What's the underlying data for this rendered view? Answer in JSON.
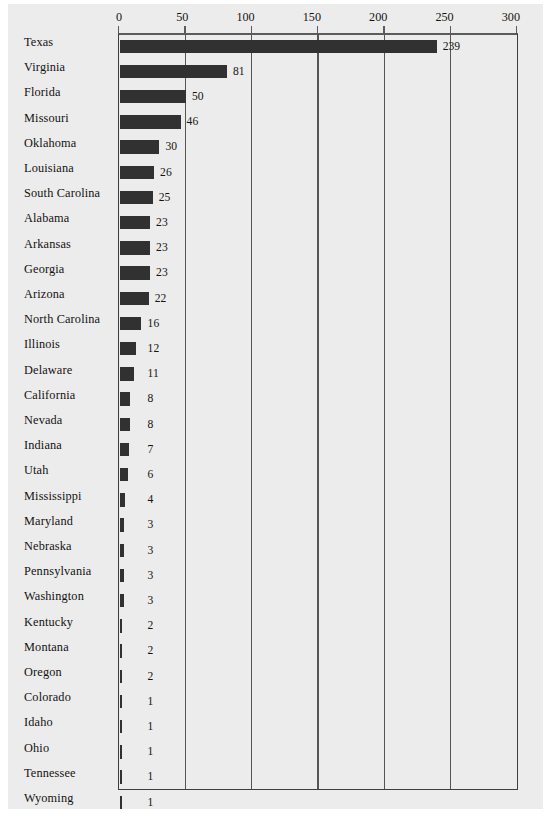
{
  "chart_data": {
    "type": "bar",
    "orientation": "horizontal",
    "title": "",
    "subtitle": "",
    "xlabel": "",
    "ylabel": "",
    "xlim": [
      0,
      300
    ],
    "xticks": [
      0,
      50,
      100,
      150,
      200,
      250,
      300
    ],
    "xtick_labels": [
      "0",
      "50",
      "100",
      "150",
      "200",
      "250",
      "300"
    ],
    "grid": true,
    "grid_axis": "x",
    "legend": false,
    "bar_color": "#313132",
    "axis_color": "#3e3e3e",
    "background_color": "#ececed",
    "value_labels": true,
    "categories": [
      "Texas",
      "Virginia",
      "Florida",
      "Missouri",
      "Oklahoma",
      "Louisiana",
      "South Carolina",
      "Alabama",
      "Arkansas",
      "Georgia",
      "Arizona",
      "North Carolina",
      "Illinois",
      "Delaware",
      "California",
      "Nevada",
      "Indiana",
      "Utah",
      "Mississippi",
      "Maryland",
      "Nebraska",
      "Pennsylvania",
      "Washington",
      "Kentucky",
      "Montana",
      "Oregon",
      "Colorado",
      "Idaho",
      "Ohio",
      "Tennessee",
      "Wyoming"
    ],
    "values": [
      239,
      81,
      50,
      46,
      30,
      26,
      25,
      23,
      23,
      23,
      22,
      16,
      12,
      11,
      8,
      8,
      7,
      6,
      4,
      3,
      3,
      3,
      3,
      2,
      2,
      2,
      1,
      1,
      1,
      1,
      1
    ],
    "value_text": [
      "239",
      "81",
      "50",
      "46",
      "30",
      "26",
      "25",
      "23",
      "23",
      "23",
      "22",
      "16",
      "12",
      "11",
      "8",
      "8",
      "7",
      "6",
      "4",
      "3",
      "3",
      "3",
      "3",
      "2",
      "2",
      "2",
      "1",
      "1",
      "1",
      "1",
      "1"
    ]
  }
}
